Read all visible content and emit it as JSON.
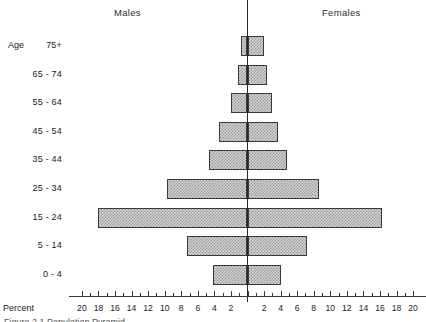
{
  "header": {
    "males_label": "Males",
    "females_label": "Females"
  },
  "axis": {
    "percent_label": "Percent",
    "age_prefix": "Age"
  },
  "caption": "Figure 2.1   Population Pyramid",
  "colors": {
    "bar_fill": "#d2d2d2",
    "bar_hatch": "#9a9a9a",
    "bar_border": "#3a3a3a",
    "axis": "#2a2a2a",
    "text": "#222222"
  },
  "chart_data": {
    "type": "bar",
    "subtype": "population-pyramid",
    "title": "",
    "xlabel": "Percent",
    "ylabel": "",
    "categories": [
      "0 - 4",
      "5 - 14",
      "15 - 24",
      "25 - 34",
      "35 - 44",
      "45 - 54",
      "55 - 64",
      "65 - 74",
      "75+"
    ],
    "category_labels_top_to_bottom": [
      "75+",
      "65 - 74",
      "55 - 64",
      "45 - 54",
      "35 - 44",
      "25 - 34",
      "15 - 24",
      "5 - 14",
      "0 - 4"
    ],
    "series": [
      {
        "name": "Males",
        "side": "left",
        "values": [
          4.2,
          7.3,
          18.0,
          9.7,
          4.6,
          3.5,
          2.0,
          1.2,
          0.8
        ]
      },
      {
        "name": "Females",
        "side": "right",
        "values": [
          4.1,
          7.2,
          16.2,
          8.6,
          4.8,
          3.7,
          3.0,
          2.4,
          2.0
        ]
      }
    ],
    "xlim": [
      -20,
      20
    ],
    "xticks_left": [
      20,
      18,
      16,
      14,
      12,
      10,
      8,
      6,
      4,
      2
    ],
    "xticks_right": [
      2,
      4,
      6,
      8,
      10,
      12,
      14,
      16,
      18,
      20
    ],
    "grid": false,
    "legend": "none",
    "center_line": true
  }
}
